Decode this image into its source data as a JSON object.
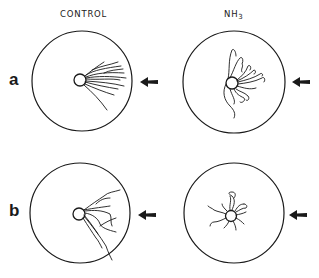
{
  "columns": [
    {
      "label": "CONTROL"
    },
    {
      "label": "NH",
      "subscript": "3"
    }
  ],
  "rows": [
    {
      "label": "a"
    },
    {
      "label": "b"
    }
  ],
  "panels": [
    {
      "row": "a",
      "column": "CONTROL",
      "pattern": "elongated-fibers-toward-arrow"
    },
    {
      "row": "a",
      "column": "NH3",
      "pattern": "curled-branched-fibers"
    },
    {
      "row": "b",
      "column": "CONTROL",
      "pattern": "elongated-fibers-toward-arrow"
    },
    {
      "row": "b",
      "column": "NH3",
      "pattern": "short-radial-curled-fibers"
    }
  ],
  "icons": {
    "arrow": "left-arrow-icon"
  },
  "colors": {
    "ink": "#1a1a1a",
    "background": "#ffffff"
  }
}
